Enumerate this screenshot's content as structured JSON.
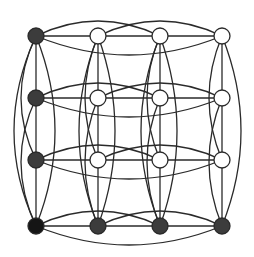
{
  "diagram": {
    "type": "graph",
    "grid": {
      "cols_x": [
        36,
        98,
        160,
        222
      ],
      "rows_y": [
        36,
        98,
        160,
        226
      ]
    },
    "colors": {
      "edge": "#2a2a2a",
      "empty_node": "#ffffff",
      "filled_node": "#3c3c3c",
      "dark_node": "#151515"
    },
    "node_radius": 8,
    "nodes": [
      {
        "row": 0,
        "col": 0,
        "fill": "filled"
      },
      {
        "row": 0,
        "col": 1,
        "fill": "empty"
      },
      {
        "row": 0,
        "col": 2,
        "fill": "empty"
      },
      {
        "row": 0,
        "col": 3,
        "fill": "empty"
      },
      {
        "row": 1,
        "col": 0,
        "fill": "filled"
      },
      {
        "row": 1,
        "col": 1,
        "fill": "empty"
      },
      {
        "row": 1,
        "col": 2,
        "fill": "empty"
      },
      {
        "row": 1,
        "col": 3,
        "fill": "empty"
      },
      {
        "row": 2,
        "col": 0,
        "fill": "filled"
      },
      {
        "row": 2,
        "col": 1,
        "fill": "empty"
      },
      {
        "row": 2,
        "col": 2,
        "fill": "empty"
      },
      {
        "row": 2,
        "col": 3,
        "fill": "empty"
      },
      {
        "row": 3,
        "col": 0,
        "fill": "dark"
      },
      {
        "row": 3,
        "col": 1,
        "fill": "filled"
      },
      {
        "row": 3,
        "col": 2,
        "fill": "filled"
      },
      {
        "row": 3,
        "col": 3,
        "fill": "filled"
      }
    ],
    "edges_per_line": "complete graph K4: adjacent straight; (0,2) and (1,3) arcs on one side; (0,3) arc on opposite side"
  }
}
